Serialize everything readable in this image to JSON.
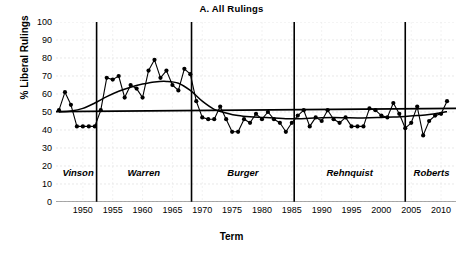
{
  "chart_data": {
    "type": "line",
    "title": "A.  All Rulings",
    "xlabel": "Term",
    "ylabel": "% Liberal Rulings",
    "xlim": [
      1945.5,
      2012.5
    ],
    "ylim": [
      0,
      100
    ],
    "grid": true,
    "legend": null,
    "yticks": [
      0,
      10,
      20,
      30,
      40,
      50,
      60,
      70,
      80,
      90,
      100
    ],
    "xticks": [
      1950,
      1955,
      1960,
      1965,
      1970,
      1975,
      1980,
      1985,
      1990,
      1995,
      2000,
      2005,
      2010
    ],
    "reference_line": {
      "label": "overall mean",
      "y_start": 50.2,
      "y_end": 52.0
    },
    "era_dividers": [
      1952.3,
      1968.2,
      1985.4,
      2004.0
    ],
    "eras": [
      {
        "name": "Vinson",
        "start": 1946,
        "end": 1952.3,
        "label_x": 1949.2,
        "label_y": 16
      },
      {
        "name": "Warren",
        "start": 1952.3,
        "end": 1968.2,
        "label_x": 1960.2,
        "label_y": 16
      },
      {
        "name": "Burger",
        "start": 1968.2,
        "end": 1985.4,
        "label_x": 1976.8,
        "label_y": 16
      },
      {
        "name": "Rehnquist",
        "start": 1985.4,
        "end": 2004.0,
        "label_x": 1994.7,
        "label_y": 16
      },
      {
        "name": "Roberts",
        "start": 2004.0,
        "end": 2012.5,
        "label_x": 2008.4,
        "label_y": 16
      }
    ],
    "series": [
      {
        "name": "% Liberal Rulings",
        "marker": "filled-circle",
        "color": "#000000",
        "x": [
          1946,
          1947,
          1948,
          1949,
          1950,
          1951,
          1952,
          1953,
          1954,
          1955,
          1956,
          1957,
          1958,
          1959,
          1960,
          1961,
          1962,
          1963,
          1964,
          1965,
          1966,
          1967,
          1968,
          1969,
          1970,
          1971,
          1972,
          1973,
          1974,
          1975,
          1976,
          1977,
          1978,
          1979,
          1980,
          1981,
          1982,
          1983,
          1984,
          1985,
          1986,
          1987,
          1988,
          1989,
          1990,
          1991,
          1992,
          1993,
          1994,
          1995,
          1996,
          1997,
          1998,
          1999,
          2000,
          2001,
          2002,
          2003,
          2004,
          2005,
          2006,
          2007,
          2008,
          2009,
          2010,
          2011
        ],
        "y": [
          51,
          61,
          54,
          42,
          42,
          42,
          42,
          51,
          69,
          68,
          70,
          58,
          65,
          63,
          58,
          73,
          79,
          69,
          73,
          65,
          62,
          74,
          71,
          56,
          47,
          46,
          46,
          53,
          46,
          39,
          39,
          46,
          44,
          49,
          46,
          50,
          46,
          44,
          39,
          44,
          48,
          51,
          42,
          47,
          45,
          51,
          46,
          44,
          47,
          42,
          42,
          42,
          52,
          51,
          48,
          47,
          55,
          49,
          41,
          44,
          53,
          37,
          45,
          48,
          49,
          56
        ]
      },
      {
        "name": "loess smooth",
        "marker": "none",
        "color": "#000000",
        "x": [
          1946,
          1948,
          1950,
          1952,
          1954,
          1956,
          1958,
          1960,
          1962,
          1964,
          1966,
          1968,
          1970,
          1972,
          1974,
          1976,
          1978,
          1980,
          1982,
          1984,
          1986,
          1988,
          1990,
          1992,
          1994,
          1996,
          1998,
          2000,
          2002,
          2004,
          2006,
          2008,
          2010,
          2011
        ],
        "y": [
          50.0,
          50.5,
          52.0,
          55.0,
          58.5,
          61.5,
          63.8,
          65.5,
          66.7,
          67.0,
          66.0,
          62.0,
          56.0,
          51.5,
          49.5,
          48.0,
          47.3,
          47.0,
          46.7,
          46.3,
          46.2,
          46.5,
          46.8,
          46.9,
          46.8,
          46.7,
          46.8,
          47.0,
          47.2,
          47.5,
          48.0,
          48.6,
          49.6,
          50.2
        ]
      }
    ]
  }
}
